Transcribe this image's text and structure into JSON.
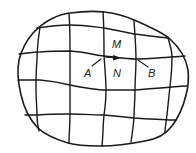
{
  "diagram": {
    "labels": {
      "m": "M",
      "n": "N",
      "a": "A",
      "b": "B"
    },
    "colors": {
      "stroke": "#1a1a1a",
      "background": "#ffffff"
    }
  }
}
